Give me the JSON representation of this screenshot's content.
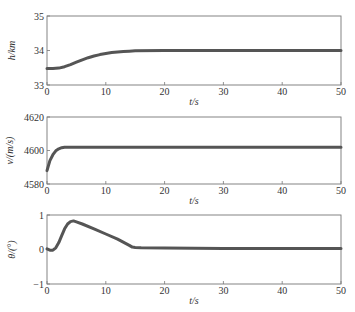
{
  "chart_data": [
    {
      "type": "line",
      "title": "",
      "xlabel": "t/s",
      "ylabel": "h/km",
      "xlim": [
        0,
        50
      ],
      "ylim": [
        33,
        35
      ],
      "xticks": [
        0,
        10,
        20,
        30,
        40,
        50
      ],
      "yticks": [
        33,
        34,
        35
      ],
      "grid": false,
      "legend": null,
      "series": [
        {
          "name": "h",
          "x": [
            0,
            1,
            2,
            3,
            4,
            5,
            6,
            7,
            8,
            9,
            10,
            11,
            12,
            13,
            14,
            15,
            20,
            30,
            40,
            50
          ],
          "values": [
            33.48,
            33.48,
            33.49,
            33.53,
            33.59,
            33.66,
            33.73,
            33.79,
            33.84,
            33.88,
            33.91,
            33.94,
            33.96,
            33.97,
            33.98,
            33.99,
            34.0,
            34.0,
            34.0,
            34.0
          ]
        }
      ]
    },
    {
      "type": "line",
      "title": "",
      "xlabel": "t/s",
      "ylabel": "v/(m/s)",
      "xlim": [
        0,
        50
      ],
      "ylim": [
        4580,
        4620
      ],
      "xticks": [
        0,
        10,
        20,
        30,
        40,
        50
      ],
      "yticks": [
        4580,
        4600,
        4620
      ],
      "grid": false,
      "legend": null,
      "series": [
        {
          "name": "v",
          "x": [
            0,
            0.5,
            1,
            1.5,
            2,
            2.5,
            3,
            4,
            5,
            10,
            20,
            30,
            40,
            50
          ],
          "values": [
            4588,
            4594,
            4597.5,
            4599.8,
            4601,
            4601.7,
            4602,
            4602,
            4602,
            4602,
            4602,
            4602,
            4602,
            4602
          ]
        }
      ]
    },
    {
      "type": "line",
      "title": "",
      "xlabel": "t/s",
      "ylabel": "θ/(°)",
      "xlim": [
        0,
        50
      ],
      "ylim": [
        -1,
        1
      ],
      "xticks": [
        0,
        10,
        20,
        30,
        40,
        50
      ],
      "yticks": [
        -1,
        0,
        1
      ],
      "grid": false,
      "legend": null,
      "series": [
        {
          "name": "θ",
          "x": [
            0,
            0.5,
            1,
            1.5,
            2,
            2.5,
            3,
            3.5,
            4,
            4.5,
            5,
            6,
            8,
            10,
            12,
            14,
            14.5,
            15,
            16,
            20,
            30,
            40,
            50
          ],
          "values": [
            0.02,
            -0.02,
            -0.02,
            0.05,
            0.2,
            0.4,
            0.6,
            0.74,
            0.81,
            0.83,
            0.8,
            0.74,
            0.6,
            0.45,
            0.3,
            0.12,
            0.07,
            0.06,
            0.05,
            0.04,
            0.03,
            0.03,
            0.03
          ]
        }
      ]
    }
  ],
  "panels": [
    {
      "ylabel": "h/km",
      "xlabel": "t/s",
      "yticks": [
        "35",
        "34",
        "33"
      ],
      "xticks": [
        "0",
        "10",
        "20",
        "30",
        "40",
        "50"
      ]
    },
    {
      "ylabel": "v/(m/s)",
      "xlabel": "t/s",
      "yticks": [
        "4620",
        "4600",
        "4580"
      ],
      "xticks": [
        "0",
        "10",
        "20",
        "30",
        "40",
        "50"
      ]
    },
    {
      "ylabel": "θ/(°)",
      "xlabel": "t/s",
      "yticks": [
        "1",
        "0",
        "−1"
      ],
      "xticks": [
        "0",
        "10",
        "20",
        "30",
        "40",
        "50"
      ]
    }
  ],
  "colors": {
    "line": "#555555",
    "axis": "#777777",
    "text": "#333333"
  }
}
